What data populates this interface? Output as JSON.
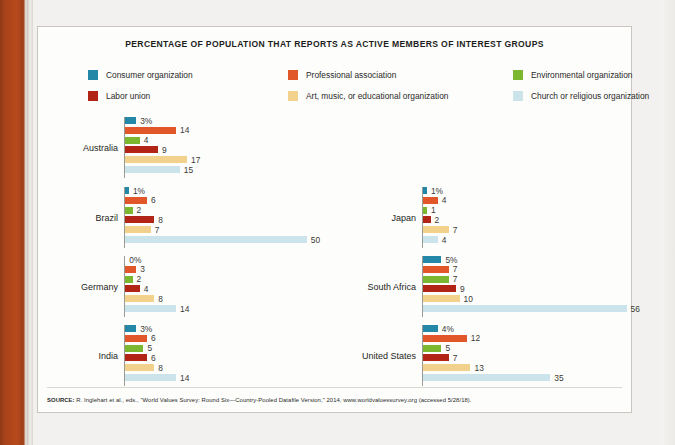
{
  "figure": {
    "title": "PERCENTAGE OF POPULATION THAT REPORTS AS  ACTIVE MEMBERS OF INTEREST GROUPS",
    "source_prefix": "SOURCE:",
    "source": "SOURCE: R. Inglehart et al., eds., \"World Values Survey: Round Six—Country-Pooled Datafile Version,\" 2014, www.worldvaluessurvey.org (accessed 5/28/18)."
  },
  "legend": [
    {
      "label": "Consumer organization",
      "color": "#2387a8"
    },
    {
      "label": "Professional association",
      "color": "#e2572a"
    },
    {
      "label": "Environmental organization",
      "color": "#7cb82f"
    },
    {
      "label": "Labor union",
      "color": "#b22415"
    },
    {
      "label": "Art, music, or educational organization",
      "color": "#f2d18c"
    },
    {
      "label": "Church or religious organization",
      "color": "#cbe4ec"
    }
  ],
  "chart_data": {
    "type": "bar",
    "title": "PERCENTAGE OF POPULATION THAT REPORTS AS  ACTIVE MEMBERS OF INTEREST GROUPS",
    "orientation": "horizontal",
    "xlabel": "",
    "ylabel": "",
    "grid": false,
    "legend_position": "top",
    "xlim": [
      0,
      60
    ],
    "categories": [
      "Australia",
      "Brazil",
      "Germany",
      "India",
      "Japan",
      "South Africa",
      "United States"
    ],
    "series": [
      {
        "name": "Consumer organization",
        "color": "#2387a8",
        "values": [
          3,
          1,
          0,
          3,
          1,
          5,
          4
        ]
      },
      {
        "name": "Professional association",
        "color": "#e2572a",
        "values": [
          14,
          6,
          3,
          6,
          4,
          7,
          12
        ]
      },
      {
        "name": "Environmental organization",
        "color": "#7cb82f",
        "values": [
          4,
          2,
          2,
          5,
          1,
          7,
          5
        ]
      },
      {
        "name": "Labor union",
        "color": "#b22415",
        "values": [
          9,
          8,
          4,
          6,
          2,
          9,
          7
        ]
      },
      {
        "name": "Art, music, or educational organization",
        "color": "#f2d18c",
        "values": [
          17,
          7,
          8,
          8,
          7,
          10,
          13
        ]
      },
      {
        "name": "Church or religious organization",
        "color": "#cbe4ec",
        "values": [
          15,
          50,
          14,
          14,
          4,
          56,
          35
        ]
      }
    ]
  },
  "panels": [
    {
      "country": "Australia",
      "bars": [
        {
          "label": "3%",
          "value": 3,
          "color": "#2387a8"
        },
        {
          "label": "14",
          "value": 14,
          "color": "#e2572a"
        },
        {
          "label": "4",
          "value": 4,
          "color": "#7cb82f"
        },
        {
          "label": "9",
          "value": 9,
          "color": "#b22415"
        },
        {
          "label": "17",
          "value": 17,
          "color": "#f2d18c"
        },
        {
          "label": "15",
          "value": 15,
          "color": "#cbe4ec"
        }
      ]
    },
    {
      "country": "Brazil",
      "bars": [
        {
          "label": "1%",
          "value": 1,
          "color": "#2387a8"
        },
        {
          "label": "6",
          "value": 6,
          "color": "#e2572a"
        },
        {
          "label": "2",
          "value": 2,
          "color": "#7cb82f"
        },
        {
          "label": "8",
          "value": 8,
          "color": "#b22415"
        },
        {
          "label": "7",
          "value": 7,
          "color": "#f2d18c"
        },
        {
          "label": "50",
          "value": 50,
          "color": "#cbe4ec"
        }
      ]
    },
    {
      "country": "Germany",
      "bars": [
        {
          "label": "0%",
          "value": 0,
          "color": "#2387a8"
        },
        {
          "label": "3",
          "value": 3,
          "color": "#e2572a"
        },
        {
          "label": "2",
          "value": 2,
          "color": "#7cb82f"
        },
        {
          "label": "4",
          "value": 4,
          "color": "#b22415"
        },
        {
          "label": "8",
          "value": 8,
          "color": "#f2d18c"
        },
        {
          "label": "14",
          "value": 14,
          "color": "#cbe4ec"
        }
      ]
    },
    {
      "country": "India",
      "bars": [
        {
          "label": "3%",
          "value": 3,
          "color": "#2387a8"
        },
        {
          "label": "6",
          "value": 6,
          "color": "#e2572a"
        },
        {
          "label": "5",
          "value": 5,
          "color": "#7cb82f"
        },
        {
          "label": "6",
          "value": 6,
          "color": "#b22415"
        },
        {
          "label": "8",
          "value": 8,
          "color": "#f2d18c"
        },
        {
          "label": "14",
          "value": 14,
          "color": "#cbe4ec"
        }
      ]
    },
    {
      "country": "Japan",
      "bars": [
        {
          "label": "1%",
          "value": 1,
          "color": "#2387a8"
        },
        {
          "label": "4",
          "value": 4,
          "color": "#e2572a"
        },
        {
          "label": "1",
          "value": 1,
          "color": "#7cb82f"
        },
        {
          "label": "2",
          "value": 2,
          "color": "#b22415"
        },
        {
          "label": "7",
          "value": 7,
          "color": "#f2d18c"
        },
        {
          "label": "4",
          "value": 4,
          "color": "#cbe4ec"
        }
      ]
    },
    {
      "country": "South Africa",
      "bars": [
        {
          "label": "5%",
          "value": 5,
          "color": "#2387a8"
        },
        {
          "label": "7",
          "value": 7,
          "color": "#e2572a"
        },
        {
          "label": "7",
          "value": 7,
          "color": "#7cb82f"
        },
        {
          "label": "9",
          "value": 9,
          "color": "#b22415"
        },
        {
          "label": "10",
          "value": 10,
          "color": "#f2d18c"
        },
        {
          "label": "56",
          "value": 56,
          "color": "#cbe4ec"
        }
      ]
    },
    {
      "country": "United States",
      "bars": [
        {
          "label": "4%",
          "value": 4,
          "color": "#2387a8"
        },
        {
          "label": "12",
          "value": 12,
          "color": "#e2572a"
        },
        {
          "label": "5",
          "value": 5,
          "color": "#7cb82f"
        },
        {
          "label": "7",
          "value": 7,
          "color": "#b22415"
        },
        {
          "label": "13",
          "value": 13,
          "color": "#f2d18c"
        },
        {
          "label": "35",
          "value": 35,
          "color": "#cbe4ec"
        }
      ]
    }
  ],
  "layout": {
    "px_per_unit": 3.63,
    "panel_positions": [
      {
        "country": "Australia",
        "left": 0,
        "top": 0
      },
      {
        "country": "Brazil",
        "left": 0,
        "top": 70
      },
      {
        "country": "Germany",
        "left": 0,
        "top": 139
      },
      {
        "country": "India",
        "left": 0,
        "top": 208
      },
      {
        "country": "Japan",
        "left": 298,
        "top": 70
      },
      {
        "country": "South Africa",
        "left": 298,
        "top": 139
      },
      {
        "country": "United States",
        "left": 298,
        "top": 208
      }
    ]
  }
}
